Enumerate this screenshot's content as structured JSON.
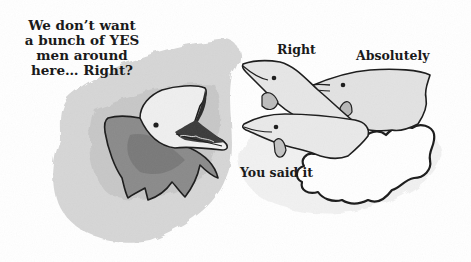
{
  "illustration": {
    "description": "Cartoon of a boss dolphin asking three dolphins a question",
    "palette": {
      "background": "#ffffff",
      "ink": "#1a1a1a",
      "wash_light": "#d6d6d6",
      "wash_mid": "#b4b4b4",
      "wash_dark": "#7e7e7e"
    }
  },
  "captions": {
    "boss_speech": "We don’t want a bunch of YES men around here… Right?",
    "dolphin_top_left": "Right",
    "dolphin_top_right": "Absolutely",
    "dolphin_bottom": "You said it"
  },
  "characters": [
    {
      "name": "boss-dolphin",
      "mouth": "open"
    },
    {
      "name": "dolphin-right"
    },
    {
      "name": "dolphin-absolutely"
    },
    {
      "name": "dolphin-you-said-it"
    }
  ]
}
